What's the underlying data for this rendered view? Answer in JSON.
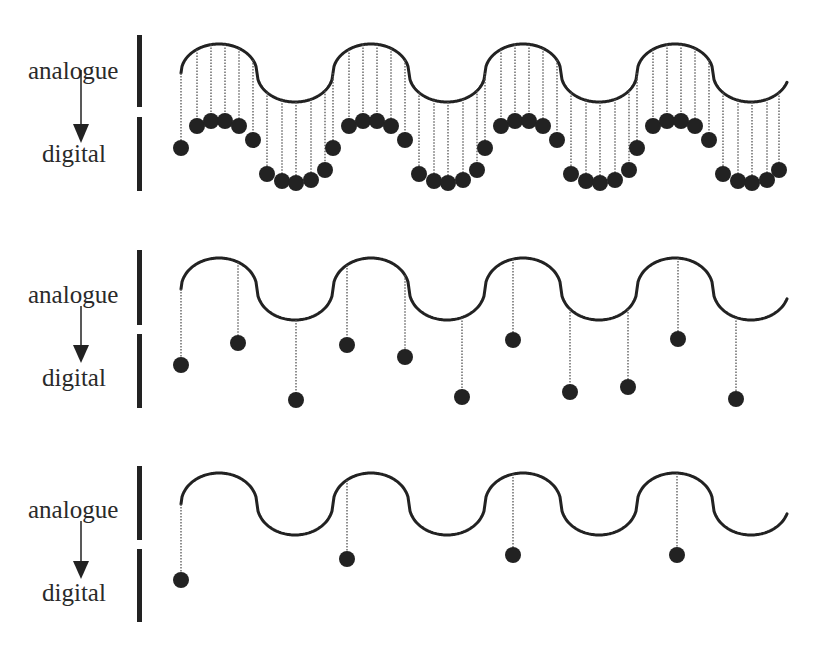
{
  "labels": {
    "analogue": "analogue",
    "digital": "digital"
  },
  "colors": {
    "ink": "#222222",
    "text": "#2a2a2a",
    "background": "#ffffff"
  },
  "panels": [
    {
      "id": "high-sample-rate",
      "wave": {
        "start_x": 181,
        "mid_y": 73,
        "amplitude": 29,
        "period": 152,
        "cycles": 4
      },
      "samples": [
        [
          181,
          148
        ],
        [
          197,
          126
        ],
        [
          211,
          121
        ],
        [
          225,
          121
        ],
        [
          239,
          126
        ],
        [
          253,
          140
        ],
        [
          267,
          174
        ],
        [
          282,
          181
        ],
        [
          296,
          183
        ],
        [
          311,
          180
        ],
        [
          325,
          170
        ],
        [
          333,
          148
        ],
        [
          349,
          126
        ],
        [
          363,
          121
        ],
        [
          377,
          121
        ],
        [
          391,
          126
        ],
        [
          405,
          140
        ],
        [
          419,
          174
        ],
        [
          434,
          181
        ],
        [
          448,
          183
        ],
        [
          463,
          180
        ],
        [
          477,
          170
        ],
        [
          485,
          148
        ],
        [
          501,
          126
        ],
        [
          515,
          121
        ],
        [
          529,
          121
        ],
        [
          543,
          126
        ],
        [
          557,
          140
        ],
        [
          571,
          174
        ],
        [
          586,
          181
        ],
        [
          600,
          183
        ],
        [
          615,
          180
        ],
        [
          629,
          170
        ],
        [
          637,
          148
        ],
        [
          653,
          126
        ],
        [
          667,
          121
        ],
        [
          681,
          121
        ],
        [
          695,
          126
        ],
        [
          709,
          140
        ],
        [
          723,
          174
        ],
        [
          738,
          181
        ],
        [
          752,
          183
        ],
        [
          767,
          180
        ],
        [
          779,
          170
        ]
      ],
      "wave_y_at_samples": "derived"
    },
    {
      "id": "medium-sample-rate",
      "wave": {
        "start_x": 181,
        "mid_y": 289,
        "amplitude": 31,
        "period": 152,
        "cycles": 4
      },
      "samples": [
        [
          181,
          365
        ],
        [
          238,
          343
        ],
        [
          296,
          400
        ],
        [
          347,
          345
        ],
        [
          405,
          357
        ],
        [
          462,
          397
        ],
        [
          513,
          340
        ],
        [
          570,
          392
        ],
        [
          628,
          387
        ],
        [
          678,
          339
        ],
        [
          736,
          399
        ]
      ]
    },
    {
      "id": "low-sample-rate",
      "wave": {
        "start_x": 181,
        "mid_y": 504,
        "amplitude": 31,
        "period": 152,
        "cycles": 4
      },
      "samples": [
        [
          181,
          580
        ],
        [
          347,
          559
        ],
        [
          513,
          555
        ],
        [
          677,
          555
        ]
      ]
    }
  ]
}
